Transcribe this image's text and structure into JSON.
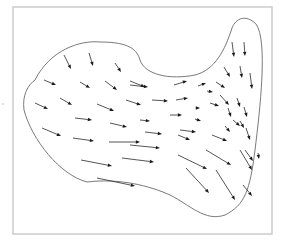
{
  "figure": {
    "colors": {
      "frame": "#c8c8c8",
      "boundary": "#6a6a6a",
      "arrow": "#1a1a1a",
      "background": "#ffffff"
    },
    "frame": {
      "x": 13,
      "y": 7,
      "width": 259,
      "height": 227
    },
    "boundary_path": "M 35 80 C 50 50, 80 40, 100 42 C 130 42, 137 50, 140 60 C 145 75, 170 80, 195 75 C 215 70, 225 50, 232 28 C 236 18, 246 14, 256 24 C 268 40, 260 110, 255 150 C 250 190, 245 205, 225 215 C 205 222, 190 205, 170 195 C 150 186, 120 178, 87 182 C 60 175, 32 140, 24 110 C 22 95, 28 85, 35 80 Z",
    "left_marker": {
      "x": 3,
      "y": 104
    },
    "arrows": [
      {
        "x1": 64,
        "y1": 55,
        "x2": 71,
        "y2": 69
      },
      {
        "x1": 89,
        "y1": 53,
        "x2": 93,
        "y2": 66
      },
      {
        "x1": 115,
        "y1": 63,
        "x2": 121,
        "y2": 72
      },
      {
        "x1": 44,
        "y1": 80,
        "x2": 56,
        "y2": 85
      },
      {
        "x1": 80,
        "y1": 82,
        "x2": 90,
        "y2": 88
      },
      {
        "x1": 105,
        "y1": 81,
        "x2": 117,
        "y2": 90
      },
      {
        "x1": 130,
        "y1": 81,
        "x2": 145,
        "y2": 87
      },
      {
        "x1": 35,
        "y1": 103,
        "x2": 48,
        "y2": 109
      },
      {
        "x1": 60,
        "y1": 98,
        "x2": 72,
        "y2": 105
      },
      {
        "x1": 97,
        "y1": 104,
        "x2": 114,
        "y2": 111
      },
      {
        "x1": 126,
        "y1": 100,
        "x2": 141,
        "y2": 105
      },
      {
        "x1": 75,
        "y1": 118,
        "x2": 92,
        "y2": 120
      },
      {
        "x1": 110,
        "y1": 123,
        "x2": 127,
        "y2": 127
      },
      {
        "x1": 140,
        "y1": 120,
        "x2": 150,
        "y2": 121
      },
      {
        "x1": 42,
        "y1": 128,
        "x2": 61,
        "y2": 136
      },
      {
        "x1": 73,
        "y1": 138,
        "x2": 94,
        "y2": 141
      },
      {
        "x1": 109,
        "y1": 142,
        "x2": 140,
        "y2": 142
      },
      {
        "x1": 130,
        "y1": 145,
        "x2": 160,
        "y2": 148
      },
      {
        "x1": 81,
        "y1": 160,
        "x2": 112,
        "y2": 166
      },
      {
        "x1": 122,
        "y1": 158,
        "x2": 154,
        "y2": 162
      },
      {
        "x1": 97,
        "y1": 178,
        "x2": 135,
        "y2": 186
      },
      {
        "x1": 130,
        "y1": 85,
        "x2": 148,
        "y2": 87
      },
      {
        "x1": 152,
        "y1": 100,
        "x2": 168,
        "y2": 101
      },
      {
        "x1": 174,
        "y1": 85,
        "x2": 187,
        "y2": 81
      },
      {
        "x1": 198,
        "y1": 86,
        "x2": 206,
        "y2": 83
      },
      {
        "x1": 176,
        "y1": 100,
        "x2": 188,
        "y2": 98
      },
      {
        "x1": 207,
        "y1": 91,
        "x2": 213,
        "y2": 92
      },
      {
        "x1": 216,
        "y1": 82,
        "x2": 225,
        "y2": 88
      },
      {
        "x1": 196,
        "y1": 108,
        "x2": 200,
        "y2": 108
      },
      {
        "x1": 210,
        "y1": 103,
        "x2": 219,
        "y2": 106
      },
      {
        "x1": 170,
        "y1": 115,
        "x2": 182,
        "y2": 115
      },
      {
        "x1": 195,
        "y1": 119,
        "x2": 201,
        "y2": 121
      },
      {
        "x1": 145,
        "y1": 132,
        "x2": 162,
        "y2": 134
      },
      {
        "x1": 180,
        "y1": 130,
        "x2": 196,
        "y2": 132
      },
      {
        "x1": 220,
        "y1": 95,
        "x2": 229,
        "y2": 105
      },
      {
        "x1": 228,
        "y1": 108,
        "x2": 231,
        "y2": 117
      },
      {
        "x1": 233,
        "y1": 120,
        "x2": 240,
        "y2": 126
      },
      {
        "x1": 240,
        "y1": 121,
        "x2": 244,
        "y2": 128
      },
      {
        "x1": 225,
        "y1": 126,
        "x2": 230,
        "y2": 132
      },
      {
        "x1": 237,
        "y1": 98,
        "x2": 240,
        "y2": 107
      },
      {
        "x1": 244,
        "y1": 107,
        "x2": 247,
        "y2": 117
      },
      {
        "x1": 246,
        "y1": 128,
        "x2": 250,
        "y2": 140
      },
      {
        "x1": 232,
        "y1": 42,
        "x2": 234,
        "y2": 57
      },
      {
        "x1": 244,
        "y1": 42,
        "x2": 245,
        "y2": 56
      },
      {
        "x1": 224,
        "y1": 67,
        "x2": 230,
        "y2": 77
      },
      {
        "x1": 240,
        "y1": 66,
        "x2": 242,
        "y2": 78
      },
      {
        "x1": 250,
        "y1": 73,
        "x2": 252,
        "y2": 89
      },
      {
        "x1": 178,
        "y1": 135,
        "x2": 190,
        "y2": 140
      },
      {
        "x1": 212,
        "y1": 135,
        "x2": 227,
        "y2": 141
      },
      {
        "x1": 178,
        "y1": 155,
        "x2": 207,
        "y2": 169
      },
      {
        "x1": 206,
        "y1": 150,
        "x2": 231,
        "y2": 165
      },
      {
        "x1": 245,
        "y1": 150,
        "x2": 253,
        "y2": 161
      },
      {
        "x1": 186,
        "y1": 168,
        "x2": 209,
        "y2": 193
      },
      {
        "x1": 216,
        "y1": 170,
        "x2": 235,
        "y2": 200
      },
      {
        "x1": 240,
        "y1": 150,
        "x2": 252,
        "y2": 170
      },
      {
        "x1": 243,
        "y1": 185,
        "x2": 252,
        "y2": 196
      },
      {
        "x1": 258,
        "y1": 153,
        "x2": 259,
        "y2": 159
      }
    ]
  }
}
